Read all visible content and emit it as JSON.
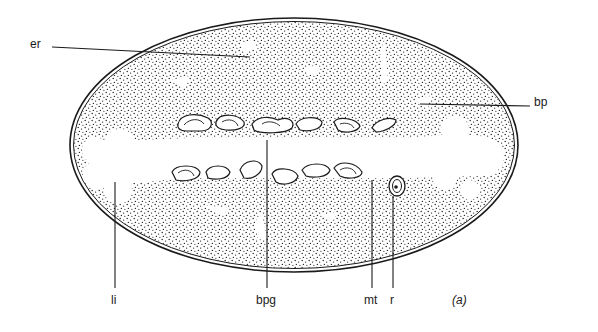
{
  "figure": {
    "panel_label": "(a)",
    "colors": {
      "ink": "#1a1a1a",
      "paper": "#ffffff",
      "stipple": "#2a2a2a"
    },
    "labels": [
      {
        "id": "er",
        "text": "er",
        "x": 30,
        "y": 44,
        "line": [
          52,
          47,
          250,
          57
        ]
      },
      {
        "id": "bp",
        "text": "bp",
        "x": 534,
        "y": 95,
        "line": [
          420,
          104,
          530,
          106
        ]
      },
      {
        "id": "li",
        "text": "li",
        "x": 110,
        "y": 295,
        "line": [
          115,
          182,
          115,
          288
        ]
      },
      {
        "id": "bpg",
        "text": "bpg",
        "x": 254,
        "y": 295,
        "line": [
          267,
          140,
          267,
          288
        ]
      },
      {
        "id": "mt",
        "text": "mt",
        "x": 364,
        "y": 295,
        "line": [
          372,
          180,
          372,
          288
        ]
      },
      {
        "id": "r",
        "text": "r",
        "x": 390,
        "y": 295,
        "line": [
          393,
          188,
          393,
          288
        ]
      }
    ]
  }
}
